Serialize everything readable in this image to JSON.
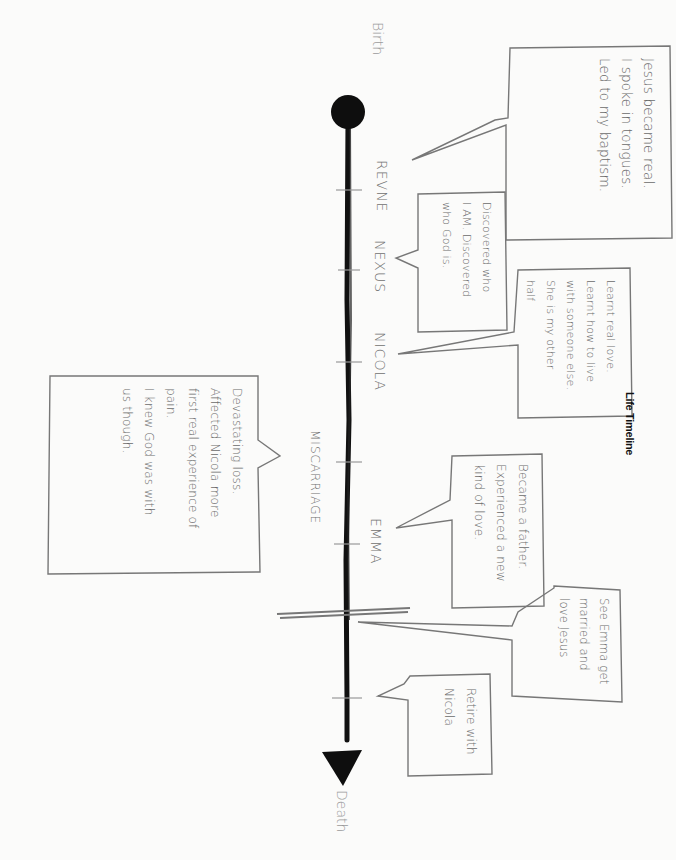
{
  "title": "Life Timeline",
  "timeline": {
    "start_label": "Birth",
    "end_label": "Death",
    "start_marker": "filled-circle",
    "end_marker": "filled-triangle",
    "milestones": [
      {
        "label": "REVNE"
      },
      {
        "label": "NEXUS"
      },
      {
        "label": "NICOLA"
      },
      {
        "label": "MISCARRIAGE"
      },
      {
        "label": "EMMA"
      }
    ]
  },
  "callouts": [
    {
      "id": "revne",
      "side": "right",
      "lines": [
        "Jesus became real.",
        "I spoke in tongues.",
        "Led to my baptism."
      ]
    },
    {
      "id": "nexus",
      "side": "right",
      "lines": [
        "Discovered who",
        "I AM. Discovered",
        "who God is."
      ]
    },
    {
      "id": "nicola",
      "side": "right",
      "lines": [
        "Learnt real love.",
        "Learnt how to live",
        "with someone else.",
        "She is my other",
        "half"
      ]
    },
    {
      "id": "miscarriage",
      "side": "left",
      "lines": [
        "Devastating loss.",
        "Affected Nicola more",
        "first real experience of",
        "pain.",
        "I knew God was with",
        "us though."
      ]
    },
    {
      "id": "emma",
      "side": "right",
      "lines": [
        "Became a father.",
        "Experienced a new",
        "kind of love."
      ]
    },
    {
      "id": "married",
      "side": "right",
      "lines": [
        "See Emma get",
        "married and",
        "love Jesus"
      ]
    },
    {
      "id": "retire",
      "side": "right",
      "lines": [
        "Retire with",
        "Nicola"
      ]
    }
  ],
  "colors": {
    "ink": "#111111",
    "pencil": "#7a7a7a",
    "paper": "#fbfbfa"
  }
}
